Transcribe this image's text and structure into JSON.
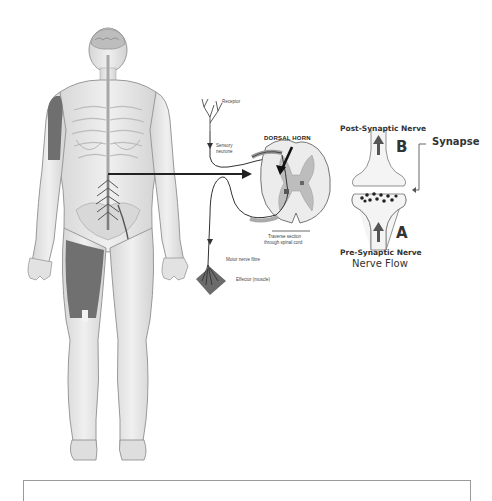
{
  "figure": {
    "body": {
      "description": "Human body with nervous system, spinal cord and nerves",
      "connector_arrow": "body-to-spinal-cord-arrow"
    },
    "reflex_arc": {
      "labels": {
        "receptor": "Receptor",
        "sensory_neurone": [
          "Sensory",
          "neurone"
        ],
        "dorsal_horn": "DORSAL HORN",
        "traverse_section": [
          "Traverse section",
          "through spinal cord"
        ],
        "motor_nerve_fibre": "Motor nerve fibre",
        "effector": "Effector (muscle)"
      }
    },
    "synapse": {
      "title": "Synapse",
      "post_synaptic": "Post-Synaptic Nerve",
      "pre_synaptic": "Pre-Synaptic Nerve",
      "label_a": "A",
      "label_b": "B",
      "flow_caption": "Nerve Flow"
    }
  },
  "caption_box": {
    "text": ""
  },
  "colors": {
    "body_fill": "#e4e4e4",
    "body_outline": "#9a9a9a",
    "muscle_dark": "#6a6a6a",
    "spine": "#bdbdbd",
    "arrow": "#222222",
    "text": "#333333"
  }
}
